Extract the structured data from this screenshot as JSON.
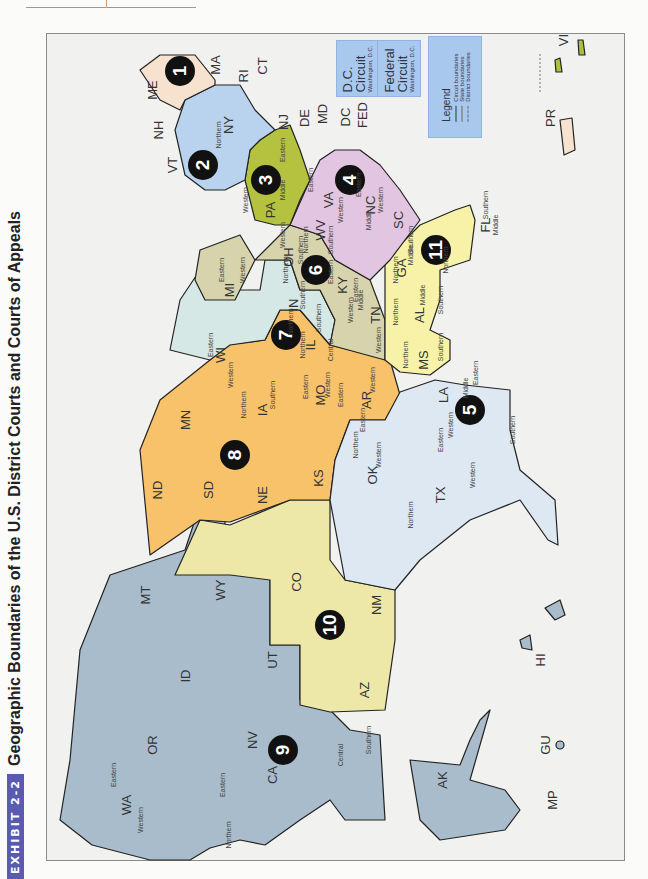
{
  "header": {
    "exhibit_label": "EXHIBIT 2-2",
    "title": "Geographic Boundaries of the U.S. District Courts and Courts of Appeals"
  },
  "colors": {
    "circuit_1": "#f6e2cf",
    "circuit_2": "#b9d3ee",
    "circuit_3": "#b5c23f",
    "circuit_4": "#e2c5e0",
    "circuit_5": "#dde8f3",
    "circuit_6": "#d6d3ad",
    "circuit_7": "#d6e8e6",
    "circuit_8": "#f7c26a",
    "circuit_9": "#a8bccc",
    "circuit_10": "#eee8a8",
    "circuit_11": "#f7f2a8",
    "territory_vi": "#a8c23f",
    "legend_bg": "#a9c8ee",
    "exhibit_badge": "#5a5bb0"
  },
  "circuit_markers": [
    "1",
    "2",
    "3",
    "4",
    "5",
    "6",
    "7",
    "8",
    "9",
    "10",
    "11"
  ],
  "special_circuits": [
    {
      "name_line1": "D.C.",
      "name_line2": "Circuit",
      "location": "Washington, D.C."
    },
    {
      "name_line1": "Federal",
      "name_line2": "Circuit",
      "location": "Washington, D.C."
    }
  ],
  "legend": {
    "title": "Legend",
    "items": [
      "Circuit boundaries",
      "State boundaries",
      "District boundaries"
    ]
  },
  "states": {
    "ME": "ME",
    "NH": "NH",
    "VT": "VT",
    "MA": "MA",
    "RI": "RI",
    "CT": "CT",
    "NY": "NY",
    "NJ": "NJ",
    "PA": "PA",
    "DE": "DE",
    "MD": "MD",
    "DC": "DC",
    "FED": "FED",
    "VA": "VA",
    "WV": "WV",
    "NC": "NC",
    "SC": "SC",
    "OH": "OH",
    "MI": "MI",
    "KY": "KY",
    "TN": "TN",
    "IN": "IN",
    "IL": "IL",
    "WI": "WI",
    "MN": "MN",
    "IA": "IA",
    "MO": "MO",
    "AR": "AR",
    "ND": "ND",
    "SD": "SD",
    "NE": "NE",
    "KS": "KS",
    "OK": "OK",
    "TX": "TX",
    "LA": "LA",
    "MS": "MS",
    "AL": "AL",
    "GA": "GA",
    "FL": "FL",
    "MT": "MT",
    "WY": "WY",
    "CO": "CO",
    "NM": "NM",
    "UT": "UT",
    "ID": "ID",
    "WA": "WA",
    "OR": "OR",
    "NV": "NV",
    "CA": "CA",
    "AZ": "AZ",
    "AK": "AK",
    "HI": "HI",
    "GU": "GU",
    "MP": "MP",
    "PR": "PR",
    "VI": "VI"
  },
  "districts": {
    "northern": "Northern",
    "southern": "Southern",
    "eastern": "Eastern",
    "western": "Western",
    "middle": "Middle",
    "central": "Central"
  }
}
